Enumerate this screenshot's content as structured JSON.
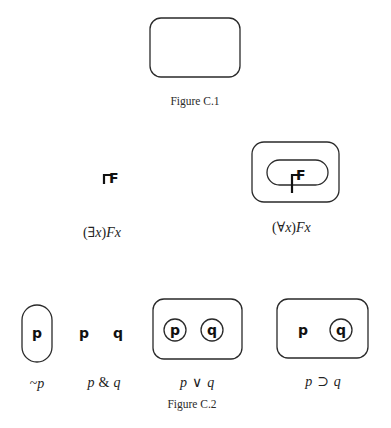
{
  "figure_c1": {
    "caption": "Figure C.1"
  },
  "figure_c2_top": {
    "existential": {
      "predicate": "F",
      "label_open": "(",
      "quantifier": "∃",
      "bound_var": "x",
      "label_close": ")",
      "label_tail": "Fx"
    },
    "universal": {
      "predicate": "F",
      "label_open": "(",
      "quantifier": "∀",
      "bound_var": "x",
      "label_close": ")",
      "label_tail": "Fx"
    }
  },
  "figure_c2_bottom": {
    "negation": {
      "var": "p",
      "label_op": "~",
      "label_var": "p"
    },
    "conjunction": {
      "var_left": "p",
      "var_right": "q",
      "label_left": "p",
      "label_op": "&",
      "label_right": "q"
    },
    "disjunction": {
      "var_left": "p",
      "var_right": "q",
      "label_left": "p",
      "label_op": "∨",
      "label_right": "q"
    },
    "implication": {
      "var_left": "p",
      "var_right": "q",
      "label_left": "p",
      "label_op": "⊃",
      "label_right": "q"
    },
    "caption": "Figure C.2"
  }
}
